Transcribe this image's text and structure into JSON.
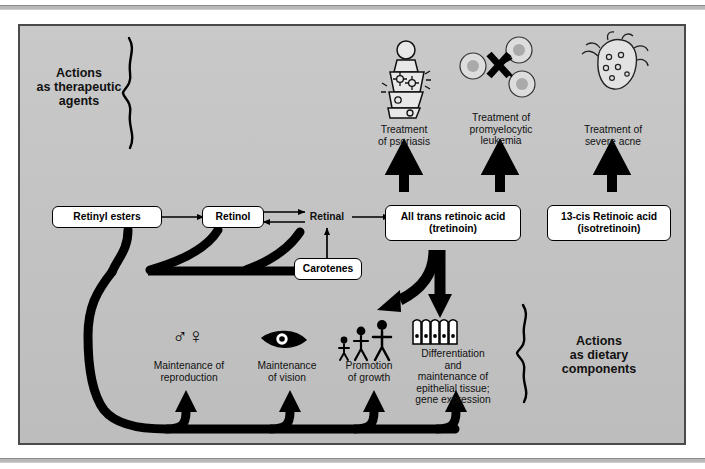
{
  "diagram": {
    "panel_bg": "#c4c4c4",
    "line_color": "#000000",
    "box_fill": "#ffffff"
  },
  "sections": {
    "therapeutic": {
      "label": "Actions\nas therapeutic\nagents",
      "line1": "Actions",
      "line2": "as therapeutic",
      "line3": "agents"
    },
    "dietary": {
      "label": "Actions\nas dietary\ncomponents",
      "line1": "Actions",
      "line2": "as dietary",
      "line3": "components"
    }
  },
  "pathway": {
    "boxes": [
      {
        "id": "retinyl-esters",
        "label": "Retinyl esters"
      },
      {
        "id": "retinol",
        "label": "Retinol"
      },
      {
        "id": "retinal",
        "label": "Retinal",
        "boxed": false
      },
      {
        "id": "carotenes",
        "label": "Carotenes"
      },
      {
        "id": "all-trans-retinoic-acid",
        "label": "All trans retinoic acid",
        "sub": "(tretinoin)"
      },
      {
        "id": "13-cis-retinoic-acid",
        "label": "13-cis Retinoic acid",
        "sub": "(isotretinoin)"
      }
    ]
  },
  "therapeutic_actions": [
    {
      "id": "psoriasis",
      "line1": "Treatment",
      "line2": "of psoriasis",
      "line3": "",
      "icon": "psoriasis-patient-icon"
    },
    {
      "id": "promyelocytic-leukemia",
      "line1": "Treatment of",
      "line2": "promyelocytic",
      "line3": "leukemia",
      "icon": "leukemia-cells-blocked-icon"
    },
    {
      "id": "severe-acne",
      "line1": "Treatment of",
      "line2": "severe acne",
      "line3": "",
      "icon": "acne-face-icon"
    }
  ],
  "dietary_actions": [
    {
      "id": "reproduction",
      "line1": "Maintenance of",
      "line2": "reproduction",
      "line3": "",
      "line4": "",
      "icon": "male-female-symbols-icon"
    },
    {
      "id": "vision",
      "line1": "Maintenance",
      "line2": "of vision",
      "line3": "",
      "line4": "",
      "icon": "eye-icon"
    },
    {
      "id": "growth",
      "line1": "Promotion",
      "line2": "of growth",
      "line3": "",
      "line4": "",
      "icon": "growing-figures-icon"
    },
    {
      "id": "epithelial",
      "line1": "Differentiation",
      "line2": "and",
      "line3": "maintenance of",
      "line4": "epithelial tissue;",
      "line5": "gene expression",
      "icon": "epithelial-cells-icon"
    }
  ],
  "symbols": {
    "male": "♂",
    "female": "♀"
  }
}
